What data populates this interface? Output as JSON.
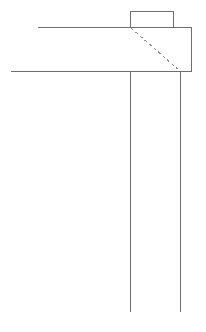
{
  "document": {
    "kind": "technical-line-drawing",
    "description": "Engineering profile sketch: flange block with hidden chamfer line and two long parallel vertical extension lines",
    "canvas": {
      "width": 206,
      "height": 332,
      "background": "#ffffff"
    }
  },
  "style": {
    "solid_color": "#6e6e6e",
    "dashed_color": "#8f8f8f",
    "solid_width": 1,
    "dashed_width": 1,
    "dash_pattern": "3 3",
    "line_cap": "butt"
  },
  "geometry": {
    "top_tab": {
      "label": "top-tab-rectangle",
      "left": 130,
      "right": 173,
      "top": 11,
      "bottom": 28,
      "open_bottom": true,
      "segments": [
        {
          "name": "tab-left-edge",
          "x1": 130,
          "y1": 11,
          "x2": 130,
          "y2": 28
        },
        {
          "name": "tab-top-edge",
          "x1": 130,
          "y1": 11,
          "x2": 173,
          "y2": 11
        },
        {
          "name": "tab-right-edge",
          "x1": 173,
          "y1": 11,
          "x2": 173,
          "y2": 28
        }
      ]
    },
    "body": {
      "label": "main-body-outline",
      "segments": [
        {
          "name": "upper-horizontal-edge",
          "x1": 38,
          "y1": 27.5,
          "x2": 192,
          "y2": 27.5
        },
        {
          "name": "lower-horizontal-edge",
          "x1": 11,
          "y1": 71.5,
          "x2": 192,
          "y2": 71.5
        },
        {
          "name": "right-vertical-edge",
          "x1": 191.5,
          "y1": 27.5,
          "x2": 191.5,
          "y2": 71.5
        }
      ]
    },
    "hidden_line": {
      "label": "hidden-chamfer-diagonal",
      "x1": 131,
      "y1": 28,
      "x2": 180,
      "y2": 71
    },
    "extension_lines": [
      {
        "name": "left-vertical-extension",
        "x1": 130.5,
        "y1": 71.5,
        "x2": 130.5,
        "y2": 312
      },
      {
        "name": "right-vertical-extension",
        "x1": 180.5,
        "y1": 71.5,
        "x2": 180.5,
        "y2": 312
      }
    ]
  }
}
